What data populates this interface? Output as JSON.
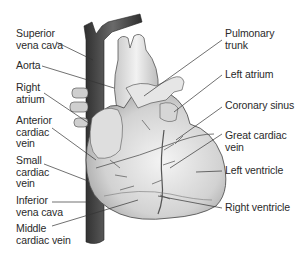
{
  "diagram": {
    "title": "",
    "colors": {
      "background": "#ffffff",
      "text": "#2a2a2a",
      "leader": "#333333",
      "vena_cava": "#4a4a4a",
      "heart": "#d8d8d8"
    },
    "labels_left": [
      {
        "id": "superior-vena-cava",
        "text": "Superior\nvena cava"
      },
      {
        "id": "aorta",
        "text": "Aorta"
      },
      {
        "id": "right-atrium",
        "text": "Right\natrium"
      },
      {
        "id": "anterior-cardiac-vein",
        "text": "Anterior\ncardiac\nvein"
      },
      {
        "id": "small-cardiac-vein",
        "text": "Small\ncardiac\nvein"
      },
      {
        "id": "inferior-vena-cava",
        "text": "Inferior\nvena cava"
      },
      {
        "id": "middle-cardiac-vein",
        "text": "Middle\ncardiac vein"
      }
    ],
    "labels_right": [
      {
        "id": "pulmonary-trunk",
        "text": "Pulmonary\ntrunk"
      },
      {
        "id": "left-atrium",
        "text": "Left atrium"
      },
      {
        "id": "coronary-sinus",
        "text": "Coronary sinus"
      },
      {
        "id": "great-cardiac-vein",
        "text": "Great cardiac\nvein"
      },
      {
        "id": "left-ventricle",
        "text": "Left ventricle"
      },
      {
        "id": "right-ventricle",
        "text": "Right ventricle"
      }
    ]
  }
}
